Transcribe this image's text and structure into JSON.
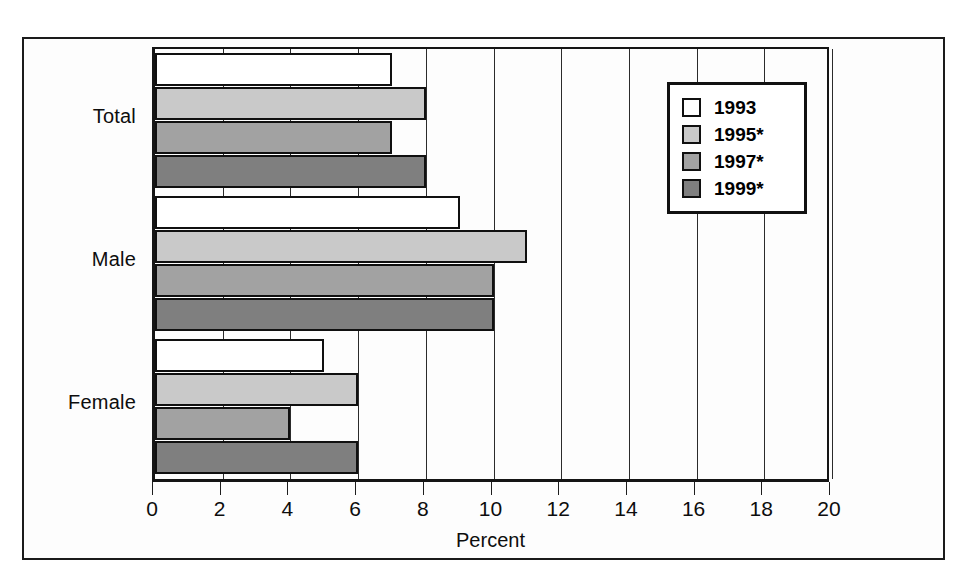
{
  "chart_data": {
    "type": "bar",
    "orientation": "horizontal",
    "title": "",
    "xlabel": "Percent",
    "ylabel": "",
    "xlim": [
      0,
      20
    ],
    "xticks": [
      0,
      2,
      4,
      6,
      8,
      10,
      12,
      14,
      16,
      18,
      20
    ],
    "xtick_labels": [
      "0",
      "2",
      "4",
      "6",
      "8",
      "10",
      "12",
      "14",
      "16",
      "18",
      "20"
    ],
    "grid": true,
    "grid_axis": "x",
    "legend_position": "top-right",
    "categories": [
      "Total",
      "Male",
      "Female"
    ],
    "series": [
      {
        "name": "1993",
        "color": "#ffffff",
        "values": [
          7,
          9,
          5
        ]
      },
      {
        "name": "1995*",
        "color": "#c9c9c9",
        "values": [
          8,
          11,
          6
        ]
      },
      {
        "name": "1997*",
        "color": "#a2a2a2",
        "values": [
          7,
          10,
          4
        ]
      },
      {
        "name": "1999*",
        "color": "#7f7f7f",
        "values": [
          8,
          10,
          6
        ]
      }
    ]
  },
  "legend": {
    "items": [
      {
        "label": "1993",
        "swatch": "legend-swatch-1993"
      },
      {
        "label": "1995*",
        "swatch": "legend-swatch-1995"
      },
      {
        "label": "1997*",
        "swatch": "legend-swatch-1997"
      },
      {
        "label": "1999*",
        "swatch": "legend-swatch-1999"
      }
    ]
  },
  "axis": {
    "x_title": "Percent",
    "tick_labels": [
      "0",
      "2",
      "4",
      "6",
      "8",
      "10",
      "12",
      "14",
      "16",
      "18",
      "20"
    ]
  },
  "categories": [
    "Total",
    "Male",
    "Female"
  ],
  "colors": {
    "series_1993": "#ffffff",
    "series_1995": "#c9c9c9",
    "series_1997": "#a2a2a2",
    "series_1999": "#7f7f7f",
    "frame": "#1b1b1b",
    "text": "#0d0d0d"
  }
}
